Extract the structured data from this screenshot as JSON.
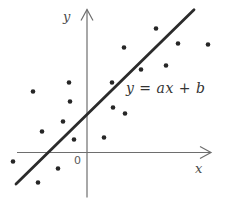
{
  "figure": {
    "colors": {
      "background": "#ffffff",
      "points": "#262626",
      "fit_line": "#2b2b2b",
      "axes": "#6e6e6e",
      "labels": "#4a4a4a"
    }
  },
  "chart_data": {
    "type": "scatter",
    "title": "",
    "xlabel": "x",
    "ylabel": "y",
    "origin_tick_label": "0",
    "grid": false,
    "legend": "none",
    "x_range": [
      -8.7,
      14.0
    ],
    "y_range": [
      -5.6,
      15.3
    ],
    "points": [
      [
        6.9,
        12.4
      ],
      [
        3.7,
        10.5
      ],
      [
        9.1,
        10.9
      ],
      [
        12.1,
        10.8
      ],
      [
        7.9,
        8.7
      ],
      [
        5.4,
        8.3
      ],
      [
        2.5,
        7.0
      ],
      [
        -1.8,
        7.0
      ],
      [
        -5.4,
        6.1
      ],
      [
        -1.7,
        5.1
      ],
      [
        2.6,
        4.5
      ],
      [
        3.8,
        3.9
      ],
      [
        -2.4,
        3.1
      ],
      [
        -4.5,
        2.1
      ],
      [
        1.7,
        1.5
      ],
      [
        -1.3,
        1.3
      ],
      [
        -7.4,
        -0.9
      ],
      [
        -2.9,
        -1.6
      ],
      [
        -4.9,
        -3.0
      ]
    ],
    "fit_line": {
      "label": "y = ax + b",
      "slope": 0.98,
      "intercept": 3.8,
      "x_start": -7.1,
      "x_end": 10.7
    },
    "axes": {
      "x_start": -7.0,
      "x_end": 12.4,
      "y_start": -4.5,
      "y_end": 14.3
    }
  }
}
